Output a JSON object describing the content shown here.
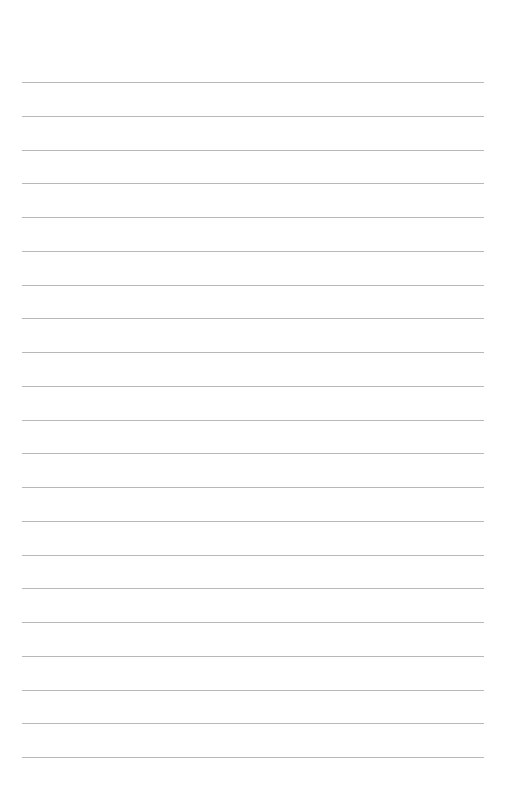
{
  "page": {
    "type": "blank lined paper",
    "line_count": 21,
    "line_color": "#b8b8b8",
    "background": "#ffffff",
    "first_line_y": 82,
    "line_spacing": 33.75,
    "line_left": 22,
    "line_right": 484
  }
}
